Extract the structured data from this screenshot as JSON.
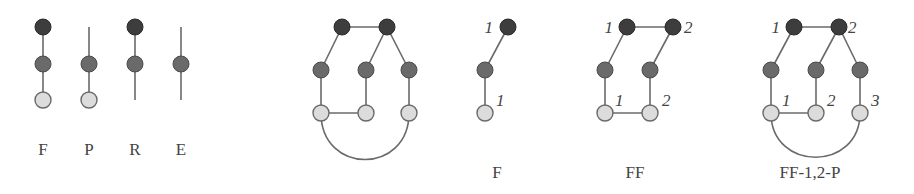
{
  "colors": {
    "dark_node": "#3d3d3d",
    "mid_node": "#6a6a6a",
    "light_node": "#dcdcdc",
    "edge": "#6a6a6a"
  },
  "legend": {
    "items": [
      {
        "label": "F",
        "description": "dark-mid-light chain"
      },
      {
        "label": "P",
        "description": "open line-mid-light"
      },
      {
        "label": "R",
        "description": "dark-mid-open line"
      },
      {
        "label": "E",
        "description": "open line-mid-open line"
      }
    ]
  },
  "graphs": [
    {
      "label": "",
      "name": "full-graph"
    },
    {
      "label": "F",
      "top_numbers": [
        "1"
      ],
      "bottom_numbers": [
        "1"
      ]
    },
    {
      "label": "FF",
      "top_numbers": [
        "1",
        "2"
      ],
      "bottom_numbers": [
        "1",
        "2"
      ]
    },
    {
      "label": "FF-1,2-P",
      "top_numbers": [
        "1",
        "2"
      ],
      "bottom_numbers": [
        "1",
        "2",
        "3"
      ]
    }
  ]
}
